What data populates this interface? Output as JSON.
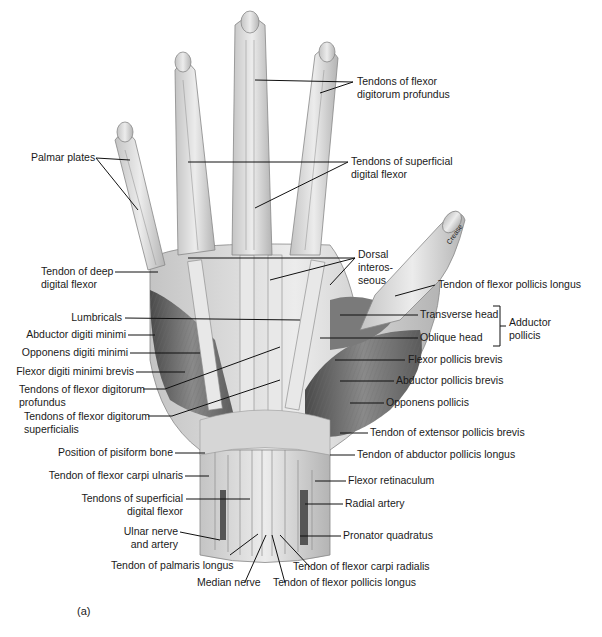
{
  "figure": {
    "caption": "(a)",
    "inline_annotation": "Crease",
    "colors": {
      "ink": "#1a1a1a",
      "skin_light": "#e4e4e4",
      "skin_mid": "#b8b8b8",
      "muscle_dark": "#5a5a5a",
      "background": "#ffffff"
    }
  },
  "labels": {
    "right": [
      {
        "id": "fdp",
        "text": "Tendons of flexor\ndigitorum profundus"
      },
      {
        "id": "fds_fingers",
        "text": "Tendons of superficial\ndigital flexor"
      },
      {
        "id": "dorsal_interosseous",
        "text": "Dorsal\ninteros-\nseous"
      },
      {
        "id": "fpl_thumb",
        "text": "Tendon of flexor pollicis longus"
      },
      {
        "id": "transverse_head",
        "text": "Transverse head"
      },
      {
        "id": "oblique_head",
        "text": "Oblique head"
      },
      {
        "id": "adductor_pollicis",
        "text": "Adductor\npollicis"
      },
      {
        "id": "fpb",
        "text": "Flexor pollicis brevis"
      },
      {
        "id": "apb",
        "text": "Abductor pollicis brevis"
      },
      {
        "id": "opponens_pollicis",
        "text": "Opponens pollicis"
      },
      {
        "id": "epb",
        "text": "Tendon of extensor pollicis brevis"
      },
      {
        "id": "apl",
        "text": "Tendon of abductor pollicis longus"
      },
      {
        "id": "flexor_retinaculum",
        "text": "Flexor retinaculum"
      },
      {
        "id": "radial_artery",
        "text": "Radial artery"
      },
      {
        "id": "pronator_quadratus",
        "text": "Pronator quadratus"
      }
    ],
    "left": [
      {
        "id": "palmar_plates",
        "text": "Palmar plates"
      },
      {
        "id": "deep_digital_flexor",
        "text": "Tendon of deep\ndigital flexor"
      },
      {
        "id": "lumbricals",
        "text": "Lumbricals"
      },
      {
        "id": "adm",
        "text": "Abductor digiti minimi"
      },
      {
        "id": "odm",
        "text": "Opponens digiti minimi"
      },
      {
        "id": "fdmb",
        "text": "Flexor digiti minimi brevis"
      },
      {
        "id": "fdp_palm",
        "text": "Tendons of flexor digitorum\nprofundus"
      },
      {
        "id": "fds_palm",
        "text": "Tendons of flexor digitorum\nsuperficialis"
      },
      {
        "id": "pisiform",
        "text": "Position of pisiform bone"
      },
      {
        "id": "fcu",
        "text": "Tendon of flexor carpi ulnaris"
      },
      {
        "id": "fds_wrist",
        "text": "Tendons of superficial\ndigital flexor"
      },
      {
        "id": "ulnar",
        "text": "Ulnar nerve\nand artery"
      }
    ],
    "bottom": [
      {
        "id": "palmaris_longus",
        "text": "Tendon of palmaris longus"
      },
      {
        "id": "median_nerve",
        "text": "Median nerve"
      },
      {
        "id": "fcr",
        "text": "Tendon of flexor carpi radialis"
      },
      {
        "id": "fpl_wrist",
        "text": "Tendon of flexor pollicis longus"
      }
    ]
  }
}
